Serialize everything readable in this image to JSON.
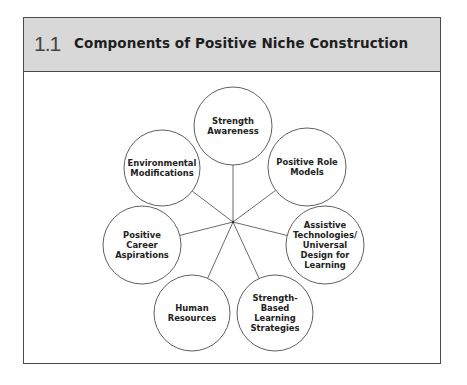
{
  "figure": {
    "number": "1.1",
    "title": "Components of Positive Niche Construction"
  },
  "diagram": {
    "type": "hub-and-spoke",
    "hub": {
      "x": 233,
      "y": 222
    },
    "nodes": [
      {
        "id": "strength-awareness",
        "lines": [
          "Strength",
          "Awareness"
        ],
        "cx": 233,
        "cy": 126,
        "r": 39
      },
      {
        "id": "positive-role-models",
        "lines": [
          "Positive Role",
          "Models"
        ],
        "cx": 307,
        "cy": 167,
        "r": 39
      },
      {
        "id": "assistive-technologies",
        "lines": [
          "Assistive",
          "Technologies/",
          "Universal",
          "Design for",
          "Learning"
        ],
        "cx": 325,
        "cy": 245,
        "r": 39
      },
      {
        "id": "strength-based-learning-strategies",
        "lines": [
          "Strength-",
          "Based",
          "Learning",
          "Strategies"
        ],
        "cx": 275,
        "cy": 313,
        "r": 38
      },
      {
        "id": "human-resources",
        "lines": [
          "Human",
          "Resources"
        ],
        "cx": 192,
        "cy": 313,
        "r": 38
      },
      {
        "id": "positive-career-aspirations",
        "lines": [
          "Positive",
          "Career",
          "Aspirations"
        ],
        "cx": 142,
        "cy": 245,
        "r": 39
      },
      {
        "id": "environmental-modifications",
        "lines": [
          "Environmental",
          "Modifications"
        ],
        "cx": 162,
        "cy": 168,
        "r": 38
      }
    ]
  }
}
